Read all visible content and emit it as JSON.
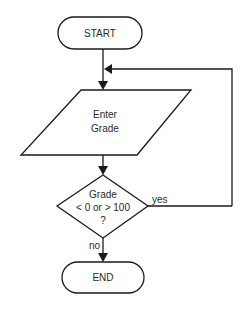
{
  "diagram": {
    "type": "flowchart",
    "nodes": {
      "start": {
        "shape": "terminator",
        "label": "START"
      },
      "input": {
        "shape": "parallelogram",
        "lines": [
          "Enter",
          "Grade"
        ]
      },
      "decision": {
        "shape": "diamond",
        "lines": [
          "Grade",
          "< 0 or > 100",
          "?"
        ]
      },
      "end": {
        "shape": "terminator",
        "label": "END"
      }
    },
    "edges": [
      {
        "from": "start",
        "to": "input",
        "label": ""
      },
      {
        "from": "input",
        "to": "decision",
        "label": ""
      },
      {
        "from": "decision",
        "to": "input",
        "label": "yes"
      },
      {
        "from": "decision",
        "to": "end",
        "label": "no"
      }
    ],
    "edge_labels": {
      "yes": "yes",
      "no": "no"
    }
  }
}
